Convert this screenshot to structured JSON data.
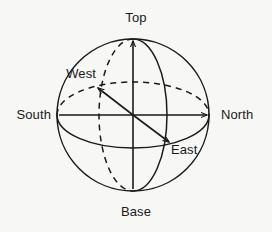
{
  "diagram": {
    "type": "3d-sphere-axes",
    "background_color": "#f7f7f5",
    "stroke_color": "#1a1a1a",
    "sphere": {
      "center_x": 133,
      "center_y": 115,
      "radius": 76
    },
    "labels": {
      "top": "Top",
      "base": "Base",
      "north": "North",
      "south": "South",
      "east": "East",
      "west": "West"
    },
    "axes": [
      {
        "name": "vertical-axis",
        "from": "Base",
        "to": "Top",
        "style": "solid"
      },
      {
        "name": "horizontal-axis",
        "from": "South",
        "to": "North",
        "style": "solid"
      },
      {
        "name": "oblique-axis",
        "from": "West",
        "to": "East",
        "style": "solid"
      }
    ],
    "great_circles": [
      {
        "name": "outline-circle",
        "style": "solid"
      },
      {
        "name": "meridian-front",
        "style": "solid"
      },
      {
        "name": "meridian-back",
        "style": "dashed"
      },
      {
        "name": "equator-front",
        "style": "solid"
      },
      {
        "name": "equator-back",
        "style": "dashed"
      }
    ]
  }
}
